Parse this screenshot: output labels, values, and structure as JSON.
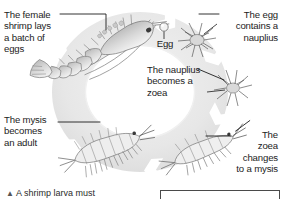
{
  "figure": {
    "type": "cycle-diagram",
    "background_color": "#ffffff",
    "ring_color": "#e6e6e6",
    "ring_shadow_color": "#d2d2d2",
    "arrow_color": "#ffffff",
    "leader_line_color": "#1c1c1c",
    "text_color": "#1c1c1c"
  },
  "labels": {
    "female_shrimp": "The female\nshrimp lays\na batch of\neggs",
    "egg": "Egg",
    "egg_contains_nauplius": "The egg\ncontains a\nnauplius",
    "nauplius_becomes_zoea": "The nauplius\nbecomes a\nzoea",
    "zoea_changes_to_mysis": "The\nzoea\nchanges\nto a mysis",
    "mysis_becomes_adult": "The mysis\nbecomes\nan adult"
  },
  "stages": [
    {
      "id": "adult-shrimp",
      "name": "Adult female shrimp",
      "label_key": "female_shrimp"
    },
    {
      "id": "egg",
      "name": "Egg",
      "label_key": "egg"
    },
    {
      "id": "nauplius",
      "name": "Nauplius",
      "label_key": "egg_contains_nauplius"
    },
    {
      "id": "zoea",
      "name": "Zoea",
      "label_key": "nauplius_becomes_zoea"
    },
    {
      "id": "mysis",
      "name": "Mysis",
      "label_key": "zoea_changes_to_mysis"
    },
    {
      "id": "juvenile",
      "name": "Juvenile / adult",
      "label_key": "mysis_becomes_adult"
    }
  ],
  "caption": {
    "bullet": "▲",
    "text": "A shrimp larva must"
  }
}
